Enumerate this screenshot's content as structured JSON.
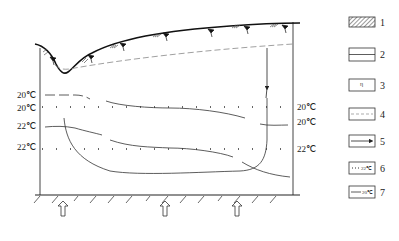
{
  "diagram": {
    "type": "hydrogeological cross-section",
    "temperature_labels_left": [
      "20℃",
      "20℃",
      "22℃",
      "22℃"
    ],
    "temperature_labels_right": [
      "20℃",
      "20℃",
      "22℃"
    ],
    "features": {
      "ground_surface": "solid line with hatched marks and spring symbols",
      "water_table": "dashed line",
      "downward_flow_arrow": "arrow from water table down right side",
      "upward_inflow_arrows": 3,
      "base": "hatched impermeable base"
    }
  },
  "legend": {
    "items": [
      {
        "number": "1",
        "symbol": "hatched-box"
      },
      {
        "number": "2",
        "symbol": "solid-line-box"
      },
      {
        "number": "3",
        "symbol": "spring-symbol-box"
      },
      {
        "number": "4",
        "symbol": "dashed-line-box"
      },
      {
        "number": "5",
        "symbol": "arrow-box"
      },
      {
        "number": "6",
        "symbol": "dotted-isotherm-box",
        "sample_text": "22℃"
      },
      {
        "number": "7",
        "symbol": "solid-isotherm-box",
        "sample_text": "20℃"
      }
    ]
  }
}
